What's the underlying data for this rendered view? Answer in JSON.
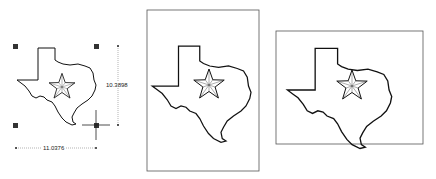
{
  "panels": [
    {
      "id": "selected",
      "description": "Texas shape selected with handles and dimension lines"
    },
    {
      "id": "portrait-frame",
      "description": "Texas shape in portrait frame"
    },
    {
      "id": "landscape-frame",
      "description": "Texas shape in landscape frame"
    }
  ],
  "dimensions": {
    "height_label": "10.3898",
    "width_label": "11.0376"
  },
  "colors": {
    "stroke": "#111111",
    "handle": "#333333",
    "frame": "#555555"
  }
}
